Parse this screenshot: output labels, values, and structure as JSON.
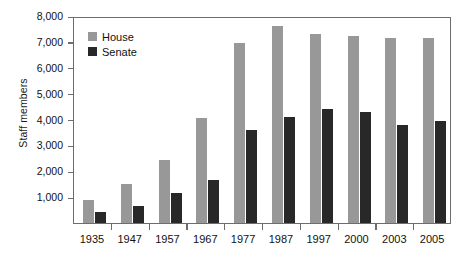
{
  "chart_data": {
    "type": "bar",
    "title": "",
    "xlabel": "",
    "ylabel": "Staff members",
    "ylim": [
      0,
      8000
    ],
    "grid": false,
    "legend_position": "top-left",
    "categories": [
      "1935",
      "1947",
      "1957",
      "1967",
      "1977",
      "1987",
      "1997",
      "2000",
      "2003",
      "2005"
    ],
    "y_ticks": [
      1000,
      2000,
      3000,
      4000,
      5000,
      6000,
      7000,
      8000
    ],
    "y_tick_labels": [
      "1,000",
      "2,000",
      "3,000",
      "4,000",
      "5,000",
      "6,000",
      "7,000",
      "8,000"
    ],
    "series": [
      {
        "name": "House",
        "color": "#989898",
        "values": [
          890,
          1490,
          2440,
          4060,
          6950,
          7630,
          7290,
          7230,
          7150,
          7160
        ]
      },
      {
        "name": "Senate",
        "color": "#282828",
        "values": [
          420,
          640,
          1150,
          1680,
          3610,
          4090,
          4410,
          4280,
          3790,
          3950
        ]
      }
    ]
  },
  "legend": {
    "items": [
      {
        "label": "House",
        "color": "#989898"
      },
      {
        "label": "Senate",
        "color": "#282828"
      }
    ]
  }
}
